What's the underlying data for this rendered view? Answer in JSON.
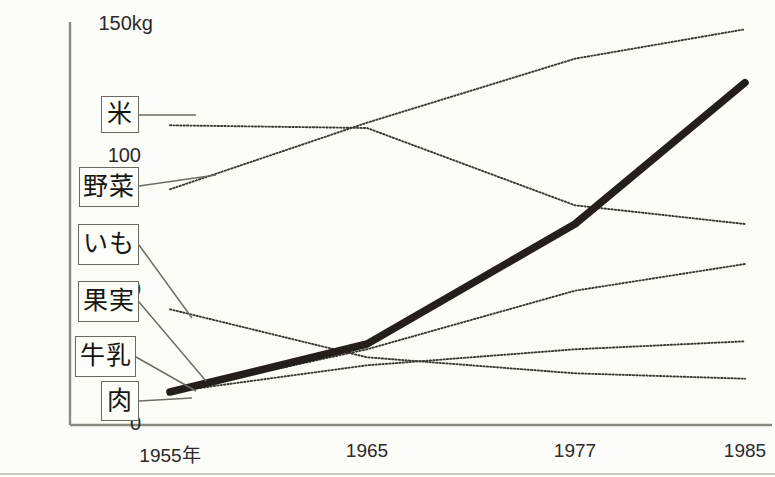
{
  "chart_data": {
    "type": "line",
    "title": "",
    "xlabel": "",
    "ylabel": "",
    "unit": "kg",
    "grid": false,
    "legend_position": "inline-left-boxes",
    "x": [
      "1955年",
      "1965",
      "1977",
      "1985"
    ],
    "x_values": [
      1955,
      1965,
      1977,
      1985
    ],
    "ylim": [
      0,
      150
    ],
    "yticks": [
      0,
      50,
      100,
      150
    ],
    "ytick_labels": [
      "0",
      "50",
      "100",
      "150kg"
    ],
    "series": [
      {
        "name": "米",
        "style": "dotted",
        "color": "#3a3a33",
        "values": [
          112,
          111,
          82,
          75
        ]
      },
      {
        "name": "野菜",
        "style": "dotted",
        "color": "#3a3a33",
        "values": [
          88,
          113,
          137,
          148
        ]
      },
      {
        "name": "いも",
        "style": "dotted",
        "color": "#3a3a33",
        "values": [
          43,
          25,
          19,
          17
        ]
      },
      {
        "name": "果実",
        "style": "dotted",
        "color": "#3a3a33",
        "values": [
          12,
          28,
          50,
          60
        ]
      },
      {
        "name": "牛乳",
        "style": "dotted",
        "color": "#3a3a33",
        "values": [
          12,
          22,
          28,
          31
        ]
      },
      {
        "name": "肉",
        "style": "thick-solid",
        "color": "#241f1a",
        "values": [
          12,
          30,
          75,
          128
        ]
      }
    ]
  },
  "axes": {
    "y_labels": {
      "top": "150kg",
      "hundred": "100",
      "fifty": "50",
      "zero": "0"
    },
    "x_labels": [
      {
        "text": "1955年",
        "px": 170
      },
      {
        "text": "1965",
        "px": 367
      },
      {
        "text": "1977",
        "px": 575
      },
      {
        "text": "1985",
        "px": 745
      }
    ]
  },
  "category_boxes": [
    {
      "label": "米",
      "x": 101,
      "y": 96,
      "w": 38,
      "h": 37
    },
    {
      "label": "野菜",
      "x": 79,
      "y": 167,
      "w": 60,
      "h": 40
    },
    {
      "label": "いも",
      "x": 78,
      "y": 224,
      "w": 61,
      "h": 41
    },
    {
      "label": "果実",
      "x": 78,
      "y": 281,
      "w": 61,
      "h": 41
    },
    {
      "label": "牛乳",
      "x": 75,
      "y": 336,
      "w": 61,
      "h": 41
    },
    {
      "label": "肉",
      "x": 101,
      "y": 381,
      "w": 38,
      "h": 40
    }
  ],
  "caption": {
    "text": ""
  }
}
